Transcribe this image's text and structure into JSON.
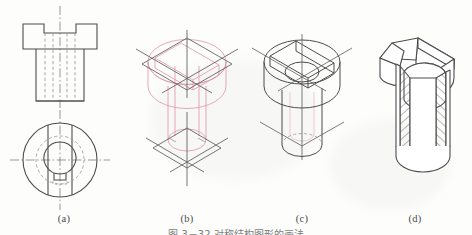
{
  "figure": {
    "title_caption": "图 3－32   对称结构图形的画法",
    "panels": [
      {
        "id": "a",
        "label": "(a)",
        "name": "orthographic-views",
        "description": "Front view and top view with centerlines and hidden lines",
        "views": [
          "front-view",
          "top-view"
        ]
      },
      {
        "id": "b",
        "label": "(b)",
        "name": "isometric-construction-boxes",
        "description": "Enclosing rhombus construction boxes for top and bottom circles",
        "views": [
          "upper-rhombus",
          "lower-rhombus",
          "cylinder-outline"
        ]
      },
      {
        "id": "c",
        "label": "(c)",
        "name": "isometric-ellipses",
        "description": "Ellipses inscribed in rhombi, slot and bore outlined",
        "views": [
          "head-ellipse",
          "shank-ellipse",
          "slot"
        ]
      },
      {
        "id": "d",
        "label": "(d)",
        "name": "finished-cutaway",
        "description": "Finished isometric cutaway with section hatching",
        "views": [
          "solid-body",
          "section-hatching"
        ]
      }
    ],
    "colors": {
      "outline": "#4d4d4d",
      "construction_pink": "#e09bab",
      "centerline": "#6b6b6b",
      "hidden_line": "#9a9a9a",
      "hatch": "#4d4d4d",
      "paper": "#fdfdfc",
      "label_text": "#4a4a4a"
    },
    "line_types": {
      "visible": "solid",
      "hidden": "dashed",
      "center": "dash-dot",
      "construction": "thin solid pink"
    }
  }
}
